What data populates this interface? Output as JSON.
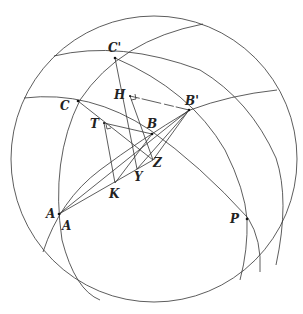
{
  "diagram": {
    "type": "spherical geometry figure",
    "sphere": {
      "cx": 154,
      "cy": 159,
      "r": 143
    },
    "labels": [
      {
        "id": "C-prime",
        "text": "C'",
        "x": 108,
        "y": 42
      },
      {
        "id": "H",
        "text": "H",
        "x": 114,
        "y": 89
      },
      {
        "id": "B-prime",
        "text": "B'",
        "x": 185,
        "y": 95
      },
      {
        "id": "C",
        "text": "C",
        "x": 60,
        "y": 100
      },
      {
        "id": "T",
        "text": "T",
        "x": 90,
        "y": 118
      },
      {
        "id": "B",
        "text": "B",
        "x": 147,
        "y": 118
      },
      {
        "id": "Z",
        "text": "Z",
        "x": 153,
        "y": 157
      },
      {
        "id": "Y",
        "text": "Y",
        "x": 134,
        "y": 171
      },
      {
        "id": "K",
        "text": "K",
        "x": 109,
        "y": 188
      },
      {
        "id": "A1",
        "text": "A",
        "x": 46,
        "y": 208
      },
      {
        "id": "A2",
        "text": "A",
        "x": 62,
        "y": 220
      },
      {
        "id": "P",
        "text": "P",
        "x": 230,
        "y": 213
      }
    ],
    "points": {
      "Cp": [
        115,
        58
      ],
      "H": [
        130,
        96
      ],
      "Bp": [
        189,
        110
      ],
      "C": [
        78,
        101
      ],
      "T": [
        104,
        123
      ],
      "B": [
        152,
        134
      ],
      "Z": [
        153,
        160
      ],
      "Y": [
        137,
        169
      ],
      "K": [
        115,
        183
      ],
      "A": [
        59,
        214
      ],
      "P": [
        247,
        219
      ]
    }
  }
}
